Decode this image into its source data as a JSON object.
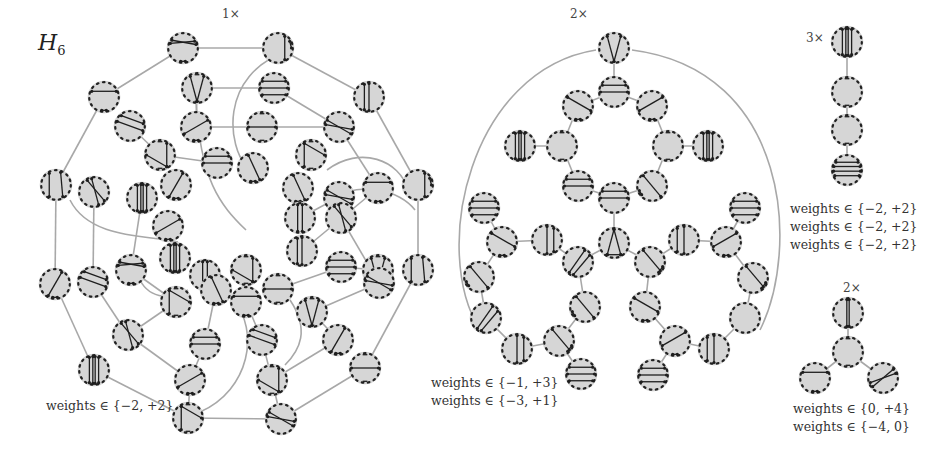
{
  "figure": {
    "title_main": "H",
    "title_sub": "6",
    "colors": {
      "node_fill": "#d6d6d6",
      "node_border_dots": "#222222",
      "chord": "#1e1e1e",
      "edge": "#a8a8a8",
      "background": "#ffffff"
    }
  },
  "panels": [
    {
      "id": "left",
      "multiplicity": "1×",
      "mult_pos": [
        222,
        8
      ],
      "weights_lines": [
        "weights ∈ {−2, +2}"
      ],
      "weights_pos": [
        46,
        399
      ],
      "nodes": [
        [
          183,
          48,
          "d1"
        ],
        [
          278,
          48,
          "v3"
        ],
        [
          104,
          97,
          "d2"
        ],
        [
          197,
          88,
          "t1"
        ],
        [
          274,
          88,
          "d3"
        ],
        [
          369,
          97,
          "v2"
        ],
        [
          130,
          126,
          "d4"
        ],
        [
          196,
          127,
          "d5"
        ],
        [
          262,
          127,
          "h1"
        ],
        [
          339,
          127,
          "d6"
        ],
        [
          160,
          155,
          "t2"
        ],
        [
          217,
          163,
          "h2"
        ],
        [
          253,
          168,
          "d7"
        ],
        [
          311,
          155,
          "t3"
        ],
        [
          56,
          185,
          "v1"
        ],
        [
          94,
          192,
          "d8"
        ],
        [
          142,
          198,
          "v4"
        ],
        [
          176,
          185,
          "d9"
        ],
        [
          298,
          188,
          "d7"
        ],
        [
          339,
          197,
          "d6"
        ],
        [
          378,
          188,
          "d2"
        ],
        [
          418,
          185,
          "v3"
        ],
        [
          168,
          226,
          "d5"
        ],
        [
          175,
          258,
          "v4"
        ],
        [
          300,
          218,
          "v5"
        ],
        [
          302,
          251,
          "v2"
        ],
        [
          341,
          218,
          "d8"
        ],
        [
          378,
          270,
          "t1"
        ],
        [
          55,
          284,
          "d9"
        ],
        [
          93,
          282,
          "d4"
        ],
        [
          131,
          270,
          "d1"
        ],
        [
          205,
          275,
          "v5"
        ],
        [
          246,
          270,
          "t2"
        ],
        [
          341,
          267,
          "d3"
        ],
        [
          379,
          283,
          "d6"
        ],
        [
          418,
          270,
          "v1"
        ],
        [
          176,
          302,
          "t3"
        ],
        [
          216,
          290,
          "d7"
        ],
        [
          246,
          302,
          "d2"
        ],
        [
          278,
          289,
          "h1"
        ],
        [
          312,
          312,
          "t1"
        ],
        [
          128,
          335,
          "d8"
        ],
        [
          205,
          344,
          "h2"
        ],
        [
          262,
          340,
          "d4"
        ],
        [
          338,
          340,
          "d9"
        ],
        [
          94,
          370,
          "v4"
        ],
        [
          190,
          380,
          "d5"
        ],
        [
          272,
          380,
          "t2"
        ],
        [
          365,
          368,
          "h1"
        ],
        [
          188,
          418,
          "t3"
        ],
        [
          281,
          419,
          "d6"
        ]
      ],
      "edges": [
        [
          0,
          1
        ],
        [
          0,
          2
        ],
        [
          1,
          5
        ],
        [
          2,
          14
        ],
        [
          3,
          4
        ],
        [
          3,
          7
        ],
        [
          4,
          9
        ],
        [
          6,
          10
        ],
        [
          8,
          7
        ],
        [
          8,
          9
        ],
        [
          5,
          21
        ],
        [
          9,
          20
        ],
        [
          10,
          11
        ],
        [
          14,
          28
        ],
        [
          15,
          29
        ],
        [
          16,
          30
        ],
        [
          19,
          24
        ],
        [
          20,
          25
        ],
        [
          21,
          35
        ],
        [
          26,
          34
        ],
        [
          27,
          33
        ],
        [
          28,
          45
        ],
        [
          29,
          41
        ],
        [
          30,
          36
        ],
        [
          31,
          37
        ],
        [
          32,
          38
        ],
        [
          33,
          39
        ],
        [
          34,
          40
        ],
        [
          35,
          48
        ],
        [
          36,
          41
        ],
        [
          37,
          42
        ],
        [
          38,
          43
        ],
        [
          40,
          44
        ],
        [
          41,
          46
        ],
        [
          42,
          46
        ],
        [
          43,
          47
        ],
        [
          44,
          47
        ],
        [
          45,
          49
        ],
        [
          46,
          49
        ],
        [
          47,
          50
        ],
        [
          48,
          50
        ],
        [
          49,
          50
        ]
      ],
      "arcs": [
        "M 290 50 C 215 75 230 150 246 165",
        "M 196 100 C 200 180 220 205 246 230",
        "M 70 200 C 90 240 150 235 178 242",
        "M 140 280 C 150 300 175 300 188 290",
        "M 327 170 C 360 145 400 160 408 190",
        "M 330 200 C 360 180 400 190 415 210",
        "M 233 300 C 260 330 250 390 200 412",
        "M 290 300 C 310 330 300 350 285 365"
      ]
    },
    {
      "id": "middle",
      "multiplicity": "2×",
      "mult_pos": [
        568,
        8
      ],
      "weights_lines": [
        "weights ∈ {−1, +3}",
        "weights ∈ {−3, +1}"
      ],
      "weights_pos": [
        431,
        378
      ],
      "nodes": [
        [
          614,
          48,
          "tri_up"
        ],
        [
          614,
          92,
          "h2"
        ],
        [
          578,
          106,
          "d10"
        ],
        [
          652,
          106,
          "d11"
        ],
        [
          520,
          146,
          "v4"
        ],
        [
          562,
          146,
          "sq_l"
        ],
        [
          668,
          146,
          "sq_r"
        ],
        [
          708,
          146,
          "v4"
        ],
        [
          578,
          186,
          "h2"
        ],
        [
          652,
          186,
          "d12"
        ],
        [
          614,
          198,
          "h2"
        ],
        [
          484,
          208,
          "d3"
        ],
        [
          745,
          208,
          "d3r"
        ],
        [
          502,
          242,
          "d10"
        ],
        [
          547,
          240,
          "v_d"
        ],
        [
          614,
          243,
          "tri_dn"
        ],
        [
          578,
          262,
          "d13"
        ],
        [
          650,
          262,
          "d14"
        ],
        [
          684,
          240,
          "v_d2"
        ],
        [
          726,
          242,
          "d11"
        ],
        [
          479,
          277,
          "d12"
        ],
        [
          753,
          278,
          "d14"
        ],
        [
          486,
          318,
          "d13"
        ],
        [
          585,
          307,
          "d12"
        ],
        [
          645,
          307,
          "d10"
        ],
        [
          745,
          318,
          "d13r"
        ],
        [
          517,
          349,
          "v_d"
        ],
        [
          559,
          341,
          "d14"
        ],
        [
          675,
          341,
          "d11"
        ],
        [
          714,
          349,
          "v_d2"
        ],
        [
          581,
          374,
          "d3"
        ],
        [
          653,
          375,
          "d3r"
        ]
      ],
      "edges": [
        [
          0,
          1
        ],
        [
          1,
          2
        ],
        [
          1,
          3
        ],
        [
          2,
          5
        ],
        [
          3,
          6
        ],
        [
          4,
          5
        ],
        [
          6,
          7
        ],
        [
          5,
          8
        ],
        [
          6,
          9
        ],
        [
          8,
          10
        ],
        [
          9,
          10
        ],
        [
          10,
          15
        ],
        [
          15,
          16
        ],
        [
          15,
          17
        ],
        [
          16,
          23
        ],
        [
          17,
          24
        ],
        [
          14,
          16
        ],
        [
          18,
          17
        ],
        [
          11,
          13
        ],
        [
          13,
          14
        ],
        [
          12,
          19
        ],
        [
          19,
          18
        ],
        [
          13,
          20
        ],
        [
          20,
          22
        ],
        [
          22,
          26
        ],
        [
          26,
          27
        ],
        [
          27,
          23
        ],
        [
          27,
          30
        ],
        [
          19,
          21
        ],
        [
          21,
          25
        ],
        [
          25,
          29
        ],
        [
          29,
          28
        ],
        [
          28,
          24
        ],
        [
          28,
          31
        ]
      ],
      "arcs": [
        "M 596 50 C 470 70 430 250 480 330",
        "M 632 50 C 790 70 800 250 760 330"
      ]
    },
    {
      "id": "right_top",
      "multiplicity": "3×",
      "mult_pos": [
        805,
        32
      ],
      "weights_lines": [
        "weights ∈ {−2, +2}",
        "weights ∈ {−2, +2}",
        "weights ∈ {−2, +2}"
      ],
      "weights_pos": [
        790,
        203
      ],
      "nodes": [
        [
          847,
          42,
          "v4"
        ],
        [
          847,
          92,
          "sq_v"
        ],
        [
          847,
          130,
          "sq_h"
        ],
        [
          847,
          170,
          "h4"
        ]
      ],
      "edges": [
        [
          0,
          1
        ],
        [
          1,
          2
        ],
        [
          2,
          3
        ]
      ]
    },
    {
      "id": "right_bottom",
      "multiplicity": "2×",
      "mult_pos": [
        842,
        282
      ],
      "weights_lines": [
        "weights ∈ {0, +4}",
        "weights ∈ {−4, 0}"
      ],
      "weights_pos": [
        793,
        403
      ],
      "nodes": [
        [
          848,
          313,
          "v2c"
        ],
        [
          848,
          352,
          "sq"
        ],
        [
          815,
          378,
          "d2"
        ],
        [
          883,
          378,
          "d2r"
        ]
      ],
      "edges": [
        [
          0,
          1
        ],
        [
          1,
          2
        ],
        [
          1,
          3
        ]
      ]
    }
  ]
}
